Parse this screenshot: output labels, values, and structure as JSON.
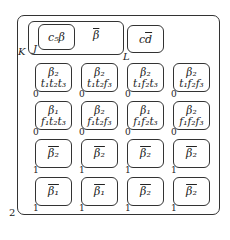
{
  "diagram": {
    "labels": {
      "K": "K",
      "J": "J",
      "L": "L",
      "outer_corner": "2"
    },
    "top_row": {
      "c5beta": "c₅β",
      "beta_bar": "β",
      "cd_bar_c": "c",
      "cd_bar_d": "d"
    },
    "grid": [
      [
        {
          "top": "β₂",
          "bottom": "t₁t₂t₃",
          "tag": "0"
        },
        {
          "top": "β₂",
          "bottom": "t₁t₂f₃",
          "tag": "0"
        },
        {
          "top": "β₂",
          "bottom": "t₁f₂t₃",
          "tag": "0"
        },
        {
          "top": "β₂",
          "bottom": "t₁f₂f₃",
          "tag": "0"
        }
      ],
      [
        {
          "top": "β₁",
          "bottom": "f₁t₂t₃",
          "tag": "0"
        },
        {
          "top": "β₂",
          "bottom": "f₁t₂f₃",
          "tag": "0"
        },
        {
          "top": "β₁",
          "bottom": "f₁f₂t₃",
          "tag": "0"
        },
        {
          "top": "β₂",
          "bottom": "f₁f₂f₃",
          "tag": "0"
        }
      ],
      [
        {
          "top": "β₂",
          "overline": true,
          "tag": "1"
        },
        {
          "top": "β₂",
          "overline": true,
          "tag": "1"
        },
        {
          "top": "β₂",
          "overline": true,
          "tag": "1"
        },
        {
          "top": "β₂",
          "overline": true,
          "tag": "1"
        }
      ],
      [
        {
          "top": "β₁",
          "overline": true,
          "tag": "1"
        },
        {
          "top": "β₁",
          "overline": true,
          "tag": "1"
        },
        {
          "top": "β₂",
          "overline": true,
          "tag": "1"
        },
        {
          "top": "β₂",
          "overline": true,
          "tag": "1"
        }
      ]
    ]
  }
}
